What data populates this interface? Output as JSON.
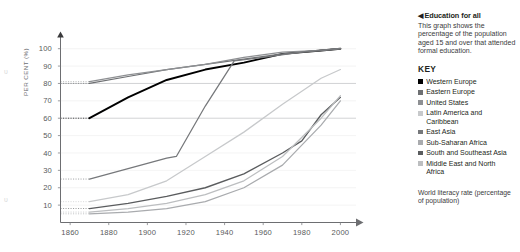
{
  "panel": {
    "caret": "◀",
    "title": "Education for all",
    "description": "This graph shows the percentage of the population aged 15 and over that attended formal education.",
    "key_heading": "KEY",
    "footnote": "World literacy rate (percentage of population)"
  },
  "chart_data": {
    "type": "line",
    "title": "Education for all",
    "xlabel": "",
    "ylabel": "PER CENT (%)",
    "xlim": [
      1855,
      2006
    ],
    "ylim": [
      0,
      105
    ],
    "grid": "horizontal-faint",
    "legend_position": "right",
    "xticks": [
      "1860",
      "1880",
      "1900",
      "1920",
      "1940",
      "1960",
      "1980",
      "2000"
    ],
    "xtick_values": [
      1860,
      1880,
      1900,
      1920,
      1940,
      1960,
      1980,
      2000
    ],
    "yticks": [
      "10",
      "20",
      "30",
      "40",
      "50",
      "60",
      "70",
      "80",
      "90",
      "100"
    ],
    "ytick_values": [
      10,
      20,
      30,
      40,
      50,
      60,
      70,
      80,
      90,
      100
    ],
    "series": [
      {
        "name": "Western Europe",
        "color": "#000000",
        "width": 1.9,
        "x": [
          1870,
          1890,
          1910,
          1930,
          1950,
          1970,
          1990,
          2000
        ],
        "values": [
          60,
          72,
          82,
          88,
          92,
          97,
          99,
          100
        ]
      },
      {
        "name": "Eastern Europe",
        "color": "#6e7073",
        "width": 1.25,
        "x": [
          1870,
          1890,
          1910,
          1930,
          1950,
          1970,
          1990,
          2000
        ],
        "values": [
          80,
          84,
          88,
          91,
          94,
          97,
          99,
          100
        ]
      },
      {
        "name": "United States",
        "color": "#8e9093",
        "width": 1.25,
        "x": [
          1870,
          1890,
          1910,
          1930,
          1950,
          1970,
          1990,
          2000
        ],
        "values": [
          81,
          85,
          88,
          91,
          95,
          98,
          99,
          100
        ]
      },
      {
        "name": "Latin America and Caribbean",
        "color": "#c7c9cb",
        "width": 1.25,
        "x": [
          1870,
          1890,
          1910,
          1930,
          1950,
          1970,
          1990,
          2000
        ],
        "values": [
          12,
          16,
          24,
          38,
          52,
          68,
          83,
          88
        ]
      },
      {
        "name": "East Asia",
        "color": "#76787b",
        "width": 1.25,
        "x": [
          1870,
          1890,
          1910,
          1915,
          1930,
          1945,
          1960,
          1980,
          2000
        ],
        "values": [
          25,
          31,
          37,
          38,
          67,
          93,
          95,
          98,
          100
        ]
      },
      {
        "name": "Sub-Saharan Africa",
        "color": "#a9abae",
        "width": 1.25,
        "x": [
          1870,
          1890,
          1910,
          1930,
          1950,
          1970,
          1990,
          2000
        ],
        "values": [
          5,
          6,
          8,
          12,
          20,
          33,
          56,
          70
        ]
      },
      {
        "name": "South and Southeast Asia",
        "color": "#5a5c5e",
        "width": 1.35,
        "x": [
          1870,
          1890,
          1910,
          1930,
          1950,
          1970,
          1980,
          1990,
          2000
        ],
        "values": [
          8,
          11,
          15,
          20,
          28,
          40,
          47,
          62,
          72
        ]
      },
      {
        "name": "Middle East and North Africa",
        "color": "#bcbec0",
        "width": 1.25,
        "x": [
          1870,
          1890,
          1910,
          1930,
          1950,
          1970,
          1990,
          2000
        ],
        "values": [
          6,
          8,
          11,
          16,
          24,
          38,
          60,
          73
        ]
      }
    ]
  },
  "bleed_marks": {
    "top": "ᴜ",
    "bottom": "ᴜ"
  }
}
